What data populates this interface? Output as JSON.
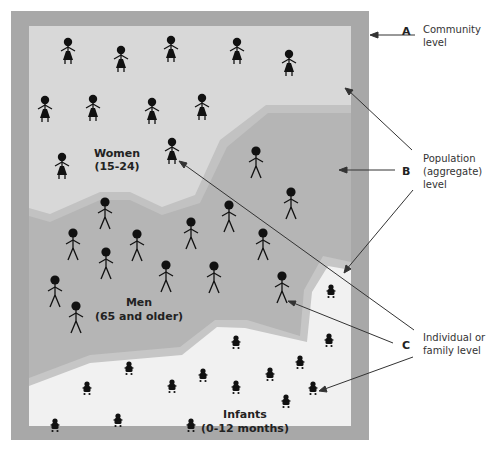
{
  "diagram": {
    "regions": [
      {
        "id": "women",
        "label_line1": "Women",
        "label_line2": "(15-24)",
        "color": "#d6d6d6"
      },
      {
        "id": "men",
        "label_line1": "Men",
        "label_line2": "(65 and older)",
        "color": "#b6b6b6"
      },
      {
        "id": "infants",
        "label_line1": "Infants",
        "label_line2": "(0-12 months)",
        "color": "#f0f0f0"
      }
    ],
    "border_color": "#a8a8a8",
    "annotations": [
      {
        "letter": "A",
        "line1": "Community",
        "line2": "level",
        "line3": ""
      },
      {
        "letter": "B",
        "line1": "Population",
        "line2": "(aggregate)",
        "line3": "level"
      },
      {
        "letter": "C",
        "line1": "Individual or",
        "line2": "family level",
        "line3": ""
      }
    ],
    "figures": {
      "women": [
        [
          68,
          52
        ],
        [
          121,
          60
        ],
        [
          171,
          50
        ],
        [
          237,
          52
        ],
        [
          289,
          64
        ],
        [
          45,
          110
        ],
        [
          93,
          109
        ],
        [
          152,
          112
        ],
        [
          202,
          108
        ],
        [
          172,
          152
        ],
        [
          62,
          167
        ]
      ],
      "men": [
        [
          105,
          214
        ],
        [
          191,
          234
        ],
        [
          229,
          217
        ],
        [
          256,
          163
        ],
        [
          291,
          204
        ],
        [
          73,
          245
        ],
        [
          137,
          246
        ],
        [
          106,
          264
        ],
        [
          166,
          277
        ],
        [
          214,
          278
        ],
        [
          263,
          245
        ],
        [
          55,
          292
        ],
        [
          76,
          318
        ],
        [
          282,
          288
        ]
      ],
      "infants": [
        [
          331,
          292
        ],
        [
          236,
          343
        ],
        [
          129,
          369
        ],
        [
          203,
          376
        ],
        [
          270,
          375
        ],
        [
          300,
          363
        ],
        [
          329,
          341
        ],
        [
          87,
          389
        ],
        [
          172,
          387
        ],
        [
          236,
          388
        ],
        [
          313,
          389
        ],
        [
          55,
          426
        ],
        [
          118,
          421
        ],
        [
          191,
          426
        ],
        [
          286,
          402
        ]
      ]
    }
  }
}
